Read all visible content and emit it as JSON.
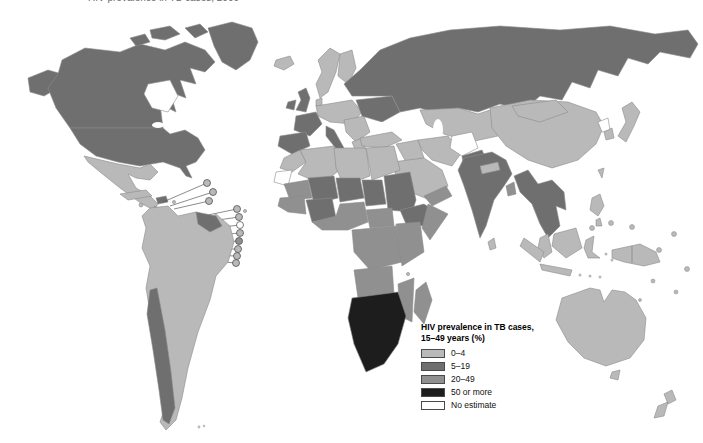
{
  "top_caption": "HIV prevalence in TB cases, 2000",
  "legend": {
    "title_line1": "HIV prevalence in TB cases,",
    "title_line2": "15–49 years (%)",
    "items": [
      {
        "label": "0–4",
        "category": "0-4"
      },
      {
        "label": "5–19",
        "category": "5-19"
      },
      {
        "label": "20–49",
        "category": "20-49"
      },
      {
        "label": "50 or more",
        "category": "50+"
      },
      {
        "label": "No estimate",
        "category": "none"
      }
    ]
  },
  "map": {
    "ocean_color": "#ffffff",
    "category_colors": {
      "0-4": "#b9b9b9",
      "5-19": "#6f6f6f",
      "20-49": "#909090",
      "50+": "#1d1d1d",
      "none": "#ffffff"
    },
    "regions": {
      "alaska": "5-19",
      "canada": "5-19",
      "usa": "5-19",
      "greenland": "5-19",
      "arctic-islands": "5-19",
      "mexico": "0-4",
      "central-america": "0-4",
      "cuba": "0-4",
      "jamaica": "0-4",
      "hispaniola": "5-19",
      "puerto-rico": "0-4",
      "south-america": "0-4",
      "chile": "5-19",
      "guyanas": "5-19",
      "falkland-islands": "0-4",
      "iceland": "0-4",
      "uk": "5-19",
      "ireland": "5-19",
      "scandinavia": "0-4",
      "finland": "0-4",
      "denmark": "0-4",
      "central-europe": "0-4",
      "france": "5-19",
      "iberia": "5-19",
      "italy": "5-19",
      "balkans": "0-4",
      "greece": "0-4",
      "ukraine-belarus": "5-19",
      "russia": "5-19",
      "kazakhstan-central-asia": "0-4",
      "turkey": "0-4",
      "iraq-syria": "0-4",
      "iran": "0-4",
      "saudi-peninsula": "0-4",
      "yemen-oman": "20-49",
      "afghanistan": "none",
      "pakistan": "5-19",
      "morocco": "0-4",
      "algeria": "0-4",
      "libya": "0-4",
      "egypt": "0-4",
      "western-sahara": "none",
      "mauritania": "20-49",
      "mali": "5-19",
      "niger": "5-19",
      "chad": "5-19",
      "sudan": "5-19",
      "ethiopia": "5-19",
      "somalia": "20-49",
      "senegal-guinea": "20-49",
      "cote-divoire-burkina": "5-19",
      "nigeria-ghana-coast": "20-49",
      "cameroon-car": "20-49",
      "drc-congo": "20-49",
      "east-africa": "20-49",
      "angola": "20-49",
      "mozambique": "20-49",
      "southern-africa": "50+",
      "madagascar": "20-49",
      "comoros": "0-4",
      "cape-verde": "0-4",
      "india": "5-19",
      "sri-lanka": "0-4",
      "nepal": "0-4",
      "bangladesh": "20-49",
      "indochina": "5-19",
      "malay-peninsula": "0-4",
      "china": "0-4",
      "mongolia": "0-4",
      "north-korea": "none",
      "south-korea": "0-4",
      "japan": "0-4",
      "taiwan": "0-4",
      "philippines": "0-4",
      "sumatra": "0-4",
      "java": "0-4",
      "borneo": "0-4",
      "sulawesi": "0-4",
      "lesser-sunda": "0-4",
      "new-guinea": "0-4",
      "australia": "0-4",
      "tasmania": "0-4",
      "new-zealand": "0-4",
      "pacific-islands": "0-4",
      "antilles-dots": "0-4",
      "callout-1": "0-4",
      "callout-2": "0-4",
      "callout-3": "0-4",
      "callout-4": "0-4",
      "callout-5": "0-4",
      "callout-6": "none",
      "callout-7": "0-4",
      "callout-8": "20-49",
      "callout-9": "0-4",
      "callout-10": "0-4",
      "callout-11": "0-4"
    }
  }
}
